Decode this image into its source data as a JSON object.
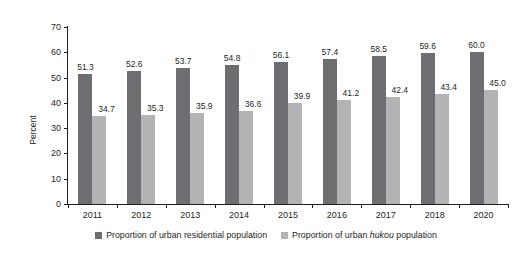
{
  "chart_data": {
    "type": "bar",
    "title": "",
    "subtitle": "",
    "xlabel": "",
    "ylabel": "Percent",
    "ylim": [
      0,
      70
    ],
    "ytick_step": 10,
    "yticks": [
      "70",
      "60",
      "50",
      "40",
      "30",
      "20",
      "10",
      "0"
    ],
    "grid": false,
    "legend_position": "bottom",
    "categories": [
      "2011",
      "2012",
      "2013",
      "2014",
      "2015",
      "2016",
      "2017",
      "2018",
      "2020"
    ],
    "series": [
      {
        "name": "Proportion of urban residential population",
        "color": "#6d6e71",
        "values": [
          51.3,
          52.6,
          53.7,
          54.8,
          56.1,
          57.4,
          58.5,
          59.6,
          60.0
        ],
        "labels": [
          "51.3",
          "52.6",
          "53.7",
          "54.8",
          "56.1",
          "57.4",
          "58.5",
          "59.6",
          "60.0"
        ]
      },
      {
        "name": "Proportion of urban hukou population",
        "color": "#b2b3b5",
        "values": [
          34.7,
          35.3,
          35.9,
          36.6,
          39.9,
          41.2,
          42.4,
          43.4,
          45.0
        ],
        "labels": [
          "34.7",
          "35.3",
          "35.9",
          "36.6",
          "39.9",
          "41.2",
          "42.4",
          "43.4",
          "45.0"
        ]
      }
    ]
  },
  "legend": {
    "items": [
      {
        "label_prefix": "Proportion of urban residential population",
        "label_italic": "",
        "label_suffix": "",
        "color": "#6d6e71"
      },
      {
        "label_prefix": "Proportion of urban ",
        "label_italic": "hukou",
        "label_suffix": " population",
        "color": "#b2b3b5"
      }
    ]
  },
  "colors": {
    "series_dark": "#6d6e71",
    "series_light": "#b2b3b5",
    "axis": "#231f20",
    "background": "#ffffff"
  }
}
